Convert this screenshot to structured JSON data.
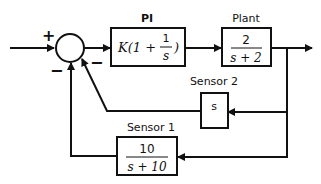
{
  "diagram": {
    "type": "control-block-diagram",
    "summing_junction": {
      "signs": [
        "+",
        "−",
        "−"
      ]
    },
    "blocks": [
      {
        "id": "pi",
        "title": "PI",
        "expr_prefix": "K(1 + ",
        "num": "1",
        "den": "s",
        "expr_suffix": ")"
      },
      {
        "id": "plant",
        "title": "Plant",
        "num": "2",
        "den": "s + 2"
      },
      {
        "id": "sensor2",
        "title": "Sensor 2",
        "tf": "s"
      },
      {
        "id": "sensor1",
        "title": "Sensor 1",
        "num": "10",
        "den": "s + 10"
      }
    ]
  }
}
